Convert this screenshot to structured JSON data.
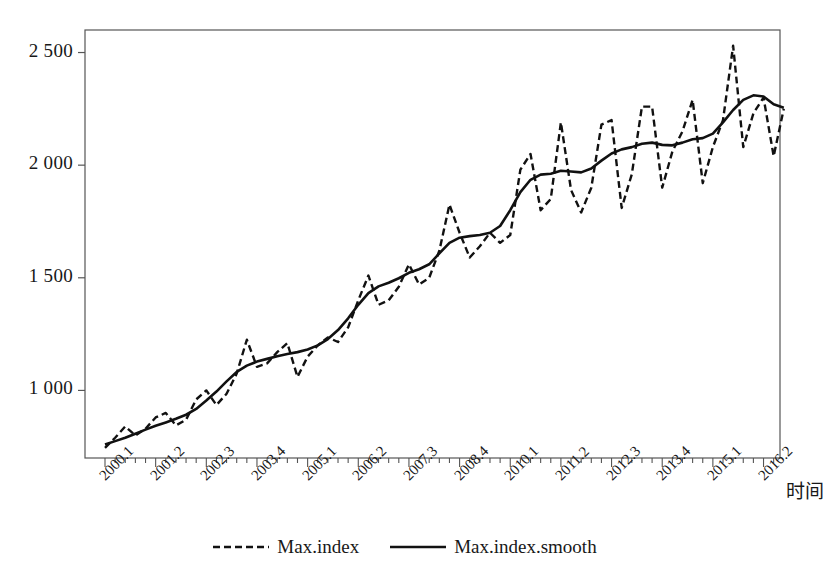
{
  "chart_data": {
    "type": "line",
    "title": "",
    "xlabel": "时间",
    "ylabel": "",
    "ylim": [
      700,
      2600
    ],
    "xlim": [
      0,
      67
    ],
    "grid": false,
    "legend_position": "bottom-center",
    "ytick_labels": [
      "1 000",
      "1 500",
      "2 000",
      "2 500"
    ],
    "ytick_values": [
      1000,
      1500,
      2000,
      2500
    ],
    "xtick_labels": [
      "2000.1",
      "2001.2",
      "2002.3",
      "2003.4",
      "2005.1",
      "2006.2",
      "2007.3",
      "2008.4",
      "2010.1",
      "2011.2",
      "2012.3",
      "2013.4",
      "2015.1",
      "2016.2"
    ],
    "xtick_indices": [
      0,
      5,
      10,
      15,
      20,
      25,
      30,
      35,
      40,
      45,
      50,
      55,
      60,
      65
    ],
    "minor_tick_count": 68,
    "x": [
      "2000.1",
      "2000.2",
      "2000.3",
      "2000.4",
      "2001.1",
      "2001.2",
      "2001.3",
      "2001.4",
      "2002.1",
      "2002.2",
      "2002.3",
      "2002.4",
      "2003.1",
      "2003.2",
      "2003.3",
      "2003.4",
      "2004.1",
      "2004.2",
      "2004.3",
      "2004.4",
      "2005.1",
      "2005.2",
      "2005.3",
      "2005.4",
      "2006.1",
      "2006.2",
      "2006.3",
      "2006.4",
      "2007.1",
      "2007.2",
      "2007.3",
      "2007.4",
      "2008.1",
      "2008.2",
      "2008.3",
      "2008.4",
      "2009.1",
      "2009.2",
      "2009.3",
      "2009.4",
      "2010.1",
      "2010.2",
      "2010.3",
      "2010.4",
      "2011.1",
      "2011.2",
      "2011.3",
      "2011.4",
      "2012.1",
      "2012.2",
      "2012.3",
      "2012.4",
      "2013.1",
      "2013.2",
      "2013.3",
      "2013.4",
      "2014.1",
      "2014.2",
      "2014.3",
      "2014.4",
      "2015.1",
      "2015.2",
      "2015.3",
      "2015.4",
      "2016.1",
      "2016.2",
      "2016.3",
      "2016.4"
    ],
    "series": [
      {
        "name": "Max.index",
        "style": "dashed",
        "color": "#111111",
        "values": [
          745,
          790,
          840,
          800,
          830,
          880,
          900,
          845,
          870,
          960,
          1000,
          935,
          985,
          1075,
          1225,
          1105,
          1120,
          1170,
          1210,
          1060,
          1150,
          1200,
          1235,
          1215,
          1280,
          1400,
          1510,
          1380,
          1400,
          1460,
          1560,
          1470,
          1500,
          1620,
          1825,
          1700,
          1590,
          1640,
          1700,
          1655,
          1690,
          1980,
          2050,
          1800,
          1850,
          2190,
          1890,
          1790,
          1900,
          2180,
          2200,
          1810,
          1960,
          2260,
          2260,
          1900,
          2060,
          2150,
          2290,
          1920,
          2080,
          2200,
          2530,
          2080,
          2230,
          2300,
          2040,
          2250
        ]
      },
      {
        "name": "Max.index.smooth",
        "style": "solid",
        "color": "#111111",
        "values": [
          760,
          775,
          790,
          808,
          826,
          843,
          858,
          874,
          892,
          918,
          955,
          995,
          1040,
          1082,
          1110,
          1128,
          1140,
          1152,
          1162,
          1170,
          1182,
          1200,
          1228,
          1268,
          1320,
          1380,
          1432,
          1462,
          1478,
          1498,
          1522,
          1538,
          1560,
          1608,
          1655,
          1678,
          1685,
          1690,
          1700,
          1730,
          1800,
          1880,
          1935,
          1958,
          1962,
          1975,
          1972,
          1968,
          1985,
          2020,
          2052,
          2070,
          2080,
          2095,
          2100,
          2090,
          2088,
          2100,
          2115,
          2120,
          2140,
          2190,
          2245,
          2290,
          2310,
          2305,
          2270,
          2255
        ]
      }
    ],
    "legend": [
      {
        "label": "Max.index",
        "style": "dashed"
      },
      {
        "label": "Max.index.smooth",
        "style": "solid"
      }
    ]
  },
  "plot_frame": {
    "left": 85,
    "top": 30,
    "right": 780,
    "bottom": 458
  }
}
